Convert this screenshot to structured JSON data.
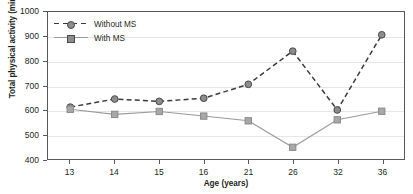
{
  "chart_data": {
    "type": "line",
    "title": "",
    "xlabel": "Age (years)",
    "ylabel_text": "Total physical activity (min · week",
    "ylabel_sup": "-1",
    "ylabel_tail": ")",
    "categories": [
      "13",
      "14",
      "15",
      "16",
      "21",
      "26",
      "32",
      "36"
    ],
    "ylim": [
      400,
      1000
    ],
    "yticks": [
      "400",
      "500",
      "600",
      "700",
      "800",
      "900",
      "1000"
    ],
    "grid": true,
    "legend_position": "top-left",
    "series": [
      {
        "name": "Without MS",
        "marker": "circle",
        "linestyle": "dashed",
        "color": "#3a3a3c",
        "marker_fill": "#8c8c8e",
        "values": [
          612,
          645,
          635,
          648,
          705,
          840,
          600,
          907
        ]
      },
      {
        "name": "With MS",
        "marker": "square",
        "linestyle": "solid",
        "color": "#9a9a9c",
        "marker_fill": "#a8a8aa",
        "values": [
          603,
          582,
          594,
          575,
          556,
          448,
          560,
          595
        ]
      }
    ]
  },
  "colors": {
    "axis": "#58585a",
    "grid": "#e6e6e6",
    "text": "#231f20",
    "without_ms": "#3a3a3c",
    "with_ms": "#9a9a9c"
  }
}
